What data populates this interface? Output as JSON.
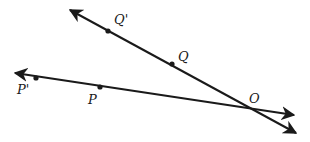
{
  "diagram": {
    "type": "geometry-rays",
    "lines": [
      {
        "name": "line-QO",
        "from": [
          70,
          10
        ],
        "to": [
          296,
          133
        ],
        "arrow_start": true,
        "arrow_end": true
      },
      {
        "name": "line-PO",
        "from": [
          15,
          73
        ],
        "to": [
          294,
          115
        ],
        "arrow_start": true,
        "arrow_end": true
      }
    ],
    "points": [
      {
        "label": "Q'",
        "x": 108,
        "y": 31,
        "lx": 114,
        "ly": 24
      },
      {
        "label": "Q",
        "x": 172,
        "y": 64,
        "lx": 178,
        "ly": 61
      },
      {
        "label": "O",
        "x": 253,
        "y": 107,
        "lx": 249,
        "ly": 103,
        "dot": false
      },
      {
        "label": "P'",
        "x": 36,
        "y": 78,
        "lx": 17,
        "ly": 94
      },
      {
        "label": "P",
        "x": 100,
        "y": 87,
        "lx": 88,
        "ly": 104
      }
    ],
    "color": "#1a1a1a"
  }
}
